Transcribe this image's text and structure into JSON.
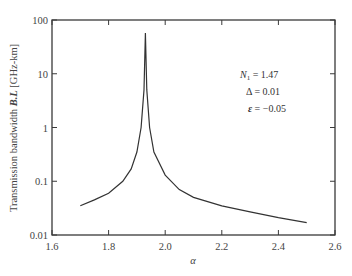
{
  "chart_data": {
    "type": "line",
    "title": "",
    "xlabel": "α",
    "ylabel": "Transmission bandwidth B.L [GHz-km]",
    "xlim": [
      1.6,
      2.6
    ],
    "ylim": [
      0.01,
      100
    ],
    "yscale": "log",
    "grid": false,
    "x_ticks": [
      "1.6",
      "1.8",
      "2.0",
      "2.2",
      "2.4",
      "2.6"
    ],
    "y_ticks": [
      "0.01",
      "0.1",
      "1",
      "10",
      "100"
    ],
    "series": [
      {
        "name": "B.L",
        "x": [
          1.7,
          1.75,
          1.8,
          1.85,
          1.88,
          1.9,
          1.915,
          1.925,
          1.93,
          1.935,
          1.945,
          1.96,
          2.0,
          2.05,
          2.1,
          2.2,
          2.3,
          2.4,
          2.5
        ],
        "values": [
          0.035,
          0.045,
          0.06,
          0.1,
          0.17,
          0.35,
          1.0,
          5.0,
          57,
          5.0,
          1.0,
          0.35,
          0.13,
          0.07,
          0.05,
          0.035,
          0.027,
          0.021,
          0.017
        ]
      }
    ],
    "annotations": [
      {
        "text": "N₁ = 1.47"
      },
      {
        "text": "Δ = 0.01"
      },
      {
        "text": "ε = −0.05"
      }
    ]
  },
  "labels": {
    "xlabel": "α",
    "ylabel_prefix": "Transmission bandwidth ",
    "ylabel_var": "B.L",
    "ylabel_suffix": " [GHz-km]",
    "ann_n1_var": "N",
    "ann_n1_sub": "1",
    "ann_n1_val": " = 1.47",
    "ann_delta": "Δ = 0.01",
    "ann_eps_var": "ε",
    "ann_eps_val": " = −0.05"
  }
}
